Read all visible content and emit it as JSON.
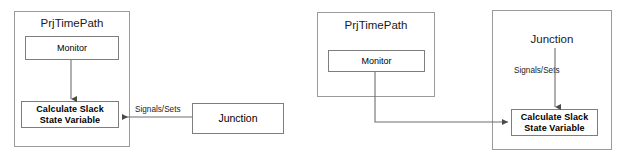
{
  "diagram": {
    "stroke_color": "#8a8a8a",
    "arrow_color": "#5a5a5a",
    "text_color": "#1a1a1a",
    "background": "#ffffff"
  },
  "left_diagram": {
    "name": "left-variant",
    "container": {
      "label": "PrjTimePath"
    },
    "monitor_box": {
      "label": "Monitor"
    },
    "calculate_box": {
      "label": "Calculate Slack\nState Variable"
    },
    "junction_box": {
      "label": "Junction"
    },
    "signal_label": "Signals/Sets"
  },
  "right_diagram": {
    "name": "right-variant",
    "prjtimepath_container": {
      "label": "PrjTimePath"
    },
    "monitor_box": {
      "label": "Monitor"
    },
    "junction_container": {
      "label": "Junction"
    },
    "calculate_box": {
      "label": "Calculate Slack\nState Variable"
    },
    "signal_label": "Signals/Sets"
  }
}
